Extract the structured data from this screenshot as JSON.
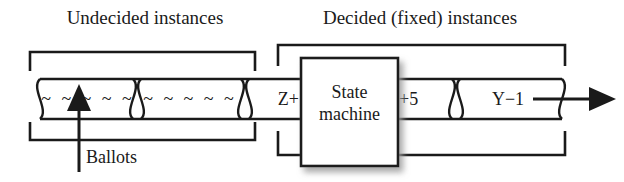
{
  "figure": {
    "title_undecided": "Undecided instances",
    "title_decided": "Decided (fixed) instances",
    "ballots_label": "Ballots",
    "colors": {
      "ink": "#1a1a1a",
      "background": "#ffffff",
      "shadow": "#bdbdbd"
    }
  },
  "pipeline": {
    "segments": [
      {
        "id": "seg-undecided-1",
        "text": "~ ~ ~ ~ ~",
        "group": "undecided"
      },
      {
        "id": "seg-undecided-2",
        "text": "~ ~ ~ ~ ~",
        "group": "undecided"
      },
      {
        "id": "seg-decided-z",
        "text": "Z+",
        "group": "decided"
      },
      {
        "id": "seg-decided-plus5",
        "text": "+5",
        "group": "decided"
      },
      {
        "id": "seg-decided-y",
        "text": "Y−1",
        "group": "decided"
      }
    ]
  },
  "state_machine": {
    "line1": "State",
    "line2": "machine"
  },
  "brackets": [
    {
      "id": "bracket-undecided",
      "label": "Undecided instances",
      "side": "top-and-bottom"
    },
    {
      "id": "bracket-decided",
      "label": "Decided (fixed) instances",
      "side": "top-and-bottom"
    }
  ]
}
